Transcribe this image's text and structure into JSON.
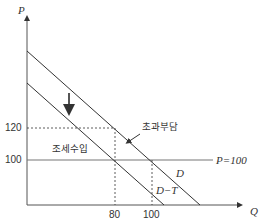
{
  "diagram": {
    "axes": {
      "y_label": "P",
      "x_label": "Q"
    },
    "ticks": {
      "y": [
        "120",
        "100"
      ],
      "x": [
        "80",
        "100"
      ]
    },
    "curves": {
      "demand": "D",
      "demand_after_tax": "D−T",
      "supply": "P=100"
    },
    "annotations": {
      "tax_revenue": "조세수입",
      "excess_burden": "초과부담"
    },
    "colors": {
      "line": "#333333",
      "background": "#ffffff"
    }
  }
}
